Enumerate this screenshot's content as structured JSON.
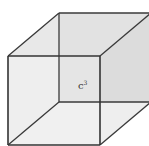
{
  "diagram": {
    "type": "cube",
    "label": {
      "base": "c",
      "exponent": "3"
    },
    "colors": {
      "edge": "#3a3a3a",
      "back_face": "#d6d6d6",
      "front_face": "#ececec",
      "side_face": "#dcdcdc",
      "top_face": "#e2e2e2",
      "bottom_face": "#eeeeee",
      "background": "#ffffff"
    },
    "vertices": {
      "front_top_left": [
        8,
        56
      ],
      "front_top_right": [
        100,
        56
      ],
      "front_bottom_left": [
        8,
        145
      ],
      "front_bottom_right": [
        100,
        145
      ],
      "back_top_left": [
        59,
        13
      ],
      "back_top_right": [
        151,
        13
      ],
      "back_bottom_left": [
        59,
        102
      ],
      "back_bottom_right": [
        151,
        102
      ]
    }
  }
}
